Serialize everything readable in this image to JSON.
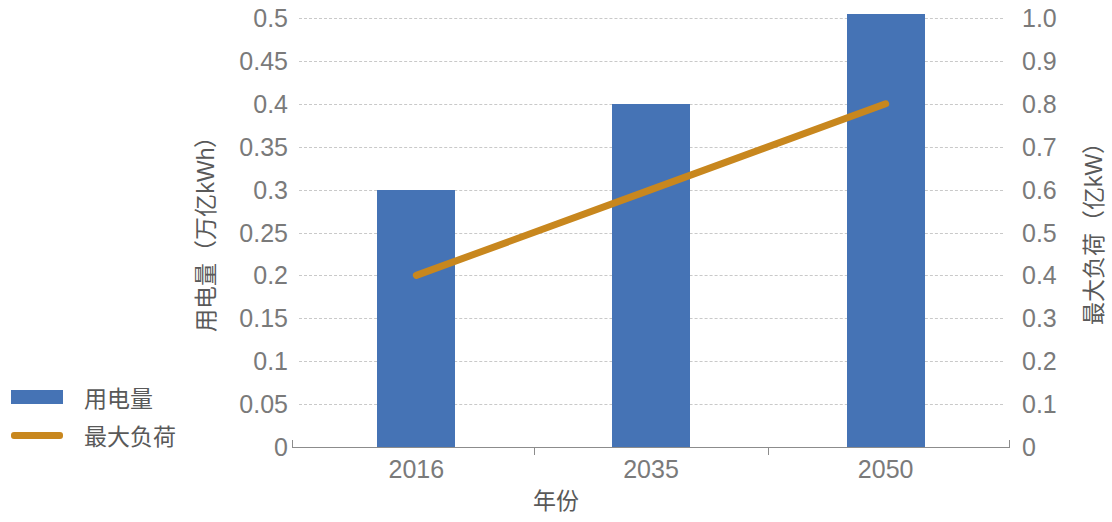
{
  "chart_data": {
    "type": "bar",
    "title": "",
    "subtitle": "",
    "xlabel": "年份",
    "ylabel": "用电量（万亿kWh）",
    "y2label": "最大负荷（亿kW）",
    "categories": [
      "2016",
      "2035",
      "2050"
    ],
    "series": [
      {
        "name": "用电量",
        "type": "bar",
        "axis": "left",
        "color": "#4573b5",
        "values": [
          0.3,
          0.4,
          0.505
        ]
      },
      {
        "name": "最大负荷",
        "type": "line",
        "axis": "right",
        "color": "#c8871e",
        "values": [
          0.4,
          0.6,
          0.8
        ]
      }
    ],
    "ylim": [
      0,
      0.5
    ],
    "y2lim": [
      0,
      1.0
    ],
    "yticks": [
      "0",
      "0.05",
      "0.1",
      "0.15",
      "0.2",
      "0.25",
      "0.3",
      "0.35",
      "0.4",
      "0.45",
      "0.5"
    ],
    "ytick_values": [
      0,
      0.05,
      0.1,
      0.15,
      0.2,
      0.25,
      0.3,
      0.35,
      0.4,
      0.45,
      0.5
    ],
    "y2ticks": [
      "0",
      "0.1",
      "0.2",
      "0.3",
      "0.4",
      "0.5",
      "0.6",
      "0.7",
      "0.8",
      "0.9",
      "1.0"
    ],
    "y2tick_values": [
      0,
      0.1,
      0.2,
      0.3,
      0.4,
      0.5,
      0.6,
      0.7,
      0.8,
      0.9,
      1.0
    ],
    "grid": true,
    "grid_style": "dashed",
    "grid_color": "#c9c9c9",
    "legend_position": "left",
    "legend": [
      {
        "label": "用电量",
        "marker": "bar-swatch",
        "color": "#4573b5"
      },
      {
        "label": "最大负荷",
        "marker": "line-swatch",
        "color": "#c8871e"
      }
    ]
  }
}
